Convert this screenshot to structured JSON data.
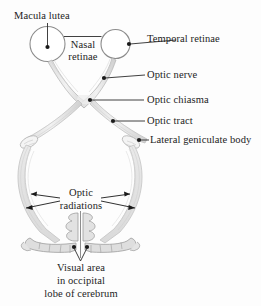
{
  "figure": {
    "background_color": "#fdfdfd",
    "line_color": "#2b2b2b",
    "structure_outline_color": "#9a9a9a",
    "structure_fill_color": "#e4e4e4"
  },
  "labels": {
    "macula_lutea": "Macula lutea",
    "nasal_retinae_line1": "Nasal",
    "nasal_retinae_line2": "retinae",
    "temporal_retinae": "Temporal retinae",
    "optic_nerve": "Optic nerve",
    "optic_chiasma": "Optic chiasma",
    "optic_tract": "Optic tract",
    "lateral_geniculate_body": "Lateral geniculate body",
    "optic_radiations_line1": "Optic",
    "optic_radiations_line2": "radiations",
    "visual_area_line1": "Visual area",
    "visual_area_line2": "in occipital",
    "visual_area_line3": "lobe of cerebrum"
  },
  "parts": [
    {
      "id": "macula-lutea",
      "name": "Macula lutea",
      "marker": "dot",
      "leader": "vertical-drop"
    },
    {
      "id": "nasal-retinae",
      "name": "Nasal retinae",
      "marker": "bracket",
      "leader": "horizontal-span"
    },
    {
      "id": "temporal-retinae",
      "name": "Temporal retinae",
      "marker": "dot",
      "leader": "horizontal"
    },
    {
      "id": "optic-nerve",
      "name": "Optic nerve",
      "marker": "dot",
      "leader": "horizontal"
    },
    {
      "id": "optic-chiasma",
      "name": "Optic chiasma",
      "marker": "dot",
      "leader": "horizontal"
    },
    {
      "id": "optic-tract",
      "name": "Optic tract",
      "marker": "dot",
      "leader": "horizontal"
    },
    {
      "id": "lateral-geniculate-body",
      "name": "Lateral geniculate body",
      "marker": "dot",
      "leader": "horizontal-short"
    },
    {
      "id": "optic-radiations",
      "name": "Optic radiations",
      "marker": "arrow",
      "leader": "four-arrows"
    },
    {
      "id": "visual-area",
      "name": "Visual area in occipital lobe of cerebrum",
      "marker": "dot-pair",
      "leader": "v-converging"
    }
  ]
}
